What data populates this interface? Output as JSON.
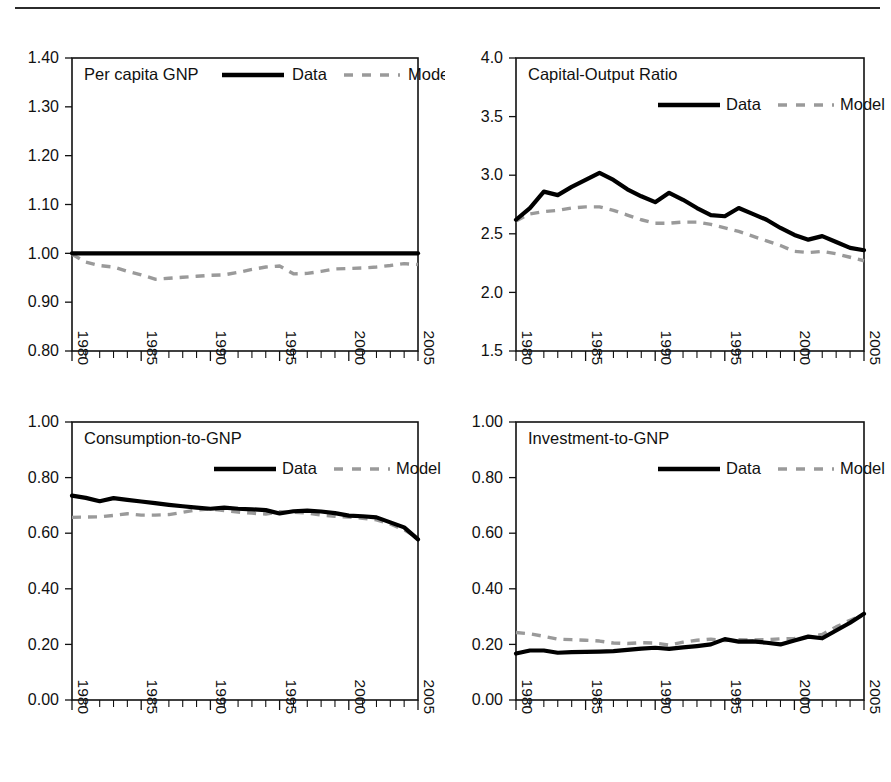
{
  "figure": {
    "top_rule": true,
    "layout": "2x2 grid of line charts",
    "legend_labels": {
      "data": "Data",
      "model": "Model"
    },
    "colors": {
      "data": "#000000",
      "model": "#9a9a9a",
      "axis": "#111111"
    }
  },
  "chart_data": [
    {
      "type": "line",
      "title": "Per capita GNP",
      "xlabel": "",
      "ylabel": "",
      "xlim": [
        1980,
        2005
      ],
      "ylim": [
        0.8,
        1.4
      ],
      "ytick_labels": [
        "0.80",
        "0.90",
        "1.00",
        "1.10",
        "1.20",
        "1.30",
        "1.40"
      ],
      "ytick_values": [
        0.8,
        0.9,
        1.0,
        1.1,
        1.2,
        1.3,
        1.4
      ],
      "xtick_labels": [
        "1980",
        "1985",
        "1990",
        "1995",
        "2000",
        "2005"
      ],
      "xtick_values": [
        1980,
        1985,
        1990,
        1995,
        2000,
        2005
      ],
      "grid": false,
      "legend_position": "top-inside",
      "x": [
        1980,
        1981,
        1982,
        1983,
        1984,
        1985,
        1986,
        1987,
        1988,
        1989,
        1990,
        1991,
        1992,
        1993,
        1994,
        1995,
        1996,
        1997,
        1998,
        1999,
        2000,
        2001,
        2002,
        2003,
        2004,
        2005
      ],
      "series": [
        {
          "name": "Data",
          "style": "solid",
          "values": [
            1.0,
            1.0,
            1.0,
            1.0,
            1.0,
            1.0,
            1.0,
            1.0,
            1.0,
            1.0,
            1.0,
            1.0,
            1.0,
            1.0,
            1.0,
            1.0,
            1.0,
            1.0,
            1.0,
            1.0,
            1.0,
            1.0,
            1.0,
            1.0,
            1.0,
            1.0
          ]
        },
        {
          "name": "Model",
          "style": "dashed",
          "values": [
            0.998,
            0.982,
            0.975,
            0.972,
            0.963,
            0.956,
            0.947,
            0.949,
            0.951,
            0.953,
            0.955,
            0.956,
            0.961,
            0.967,
            0.972,
            0.974,
            0.958,
            0.959,
            0.963,
            0.968,
            0.969,
            0.97,
            0.972,
            0.975,
            0.979,
            0.977
          ]
        }
      ]
    },
    {
      "type": "line",
      "title": "Capital-Output Ratio",
      "xlabel": "",
      "ylabel": "",
      "xlim": [
        1980,
        2005
      ],
      "ylim": [
        1.5,
        4.0
      ],
      "ytick_labels": [
        "1.5",
        "2.0",
        "2.5",
        "3.0",
        "3.5",
        "4.0"
      ],
      "ytick_values": [
        1.5,
        2.0,
        2.5,
        3.0,
        3.5,
        4.0
      ],
      "xtick_labels": [
        "1980",
        "1985",
        "1990",
        "1995",
        "2000",
        "2005"
      ],
      "xtick_values": [
        1980,
        1985,
        1990,
        1995,
        2000,
        2005
      ],
      "grid": false,
      "legend_position": "top-inside",
      "x": [
        1980,
        1981,
        1982,
        1983,
        1984,
        1985,
        1986,
        1987,
        1988,
        1989,
        1990,
        1991,
        1992,
        1993,
        1994,
        1995,
        1996,
        1997,
        1998,
        1999,
        2000,
        2001,
        2002,
        2003,
        2004,
        2005
      ],
      "series": [
        {
          "name": "Data",
          "style": "solid",
          "values": [
            2.62,
            2.72,
            2.86,
            2.83,
            2.9,
            2.96,
            3.02,
            2.96,
            2.88,
            2.82,
            2.77,
            2.85,
            2.79,
            2.72,
            2.66,
            2.65,
            2.72,
            2.67,
            2.62,
            2.55,
            2.49,
            2.45,
            2.48,
            2.43,
            2.38,
            2.36
          ]
        },
        {
          "name": "Model",
          "style": "dashed",
          "values": [
            2.61,
            2.67,
            2.69,
            2.7,
            2.72,
            2.73,
            2.73,
            2.7,
            2.66,
            2.62,
            2.59,
            2.59,
            2.6,
            2.6,
            2.58,
            2.55,
            2.52,
            2.48,
            2.44,
            2.4,
            2.35,
            2.34,
            2.35,
            2.33,
            2.3,
            2.27
          ]
        }
      ]
    },
    {
      "type": "line",
      "title": "Consumption-to-GNP",
      "xlabel": "",
      "ylabel": "",
      "xlim": [
        1980,
        2005
      ],
      "ylim": [
        0.0,
        1.0
      ],
      "ytick_labels": [
        "0.00",
        "0.20",
        "0.40",
        "0.60",
        "0.80",
        "1.00"
      ],
      "ytick_values": [
        0.0,
        0.2,
        0.4,
        0.6,
        0.8,
        1.0
      ],
      "xtick_labels": [
        "1980",
        "1985",
        "1990",
        "1995",
        "2000",
        "2005"
      ],
      "xtick_values": [
        1980,
        1985,
        1990,
        1995,
        2000,
        2005
      ],
      "grid": false,
      "legend_position": "top-inside",
      "x": [
        1980,
        1981,
        1982,
        1983,
        1984,
        1985,
        1986,
        1987,
        1988,
        1989,
        1990,
        1991,
        1992,
        1993,
        1994,
        1995,
        1996,
        1997,
        1998,
        1999,
        2000,
        2001,
        2002,
        2003,
        2004,
        2005
      ],
      "series": [
        {
          "name": "Data",
          "style": "solid",
          "values": [
            0.735,
            0.727,
            0.715,
            0.726,
            0.72,
            0.714,
            0.708,
            0.702,
            0.697,
            0.692,
            0.688,
            0.692,
            0.688,
            0.686,
            0.683,
            0.671,
            0.679,
            0.681,
            0.678,
            0.672,
            0.663,
            0.661,
            0.657,
            0.639,
            0.621,
            0.578
          ]
        },
        {
          "name": "Model",
          "style": "dashed",
          "values": [
            0.657,
            0.658,
            0.659,
            0.664,
            0.67,
            0.665,
            0.665,
            0.667,
            0.675,
            0.684,
            0.687,
            0.681,
            0.676,
            0.672,
            0.669,
            0.677,
            0.676,
            0.672,
            0.665,
            0.661,
            0.658,
            0.654,
            0.648,
            0.633,
            0.612,
            0.583
          ]
        }
      ]
    },
    {
      "type": "line",
      "title": "Investment-to-GNP",
      "xlabel": "",
      "ylabel": "",
      "xlim": [
        1980,
        2005
      ],
      "ylim": [
        0.0,
        1.0
      ],
      "ytick_labels": [
        "0.00",
        "0.20",
        "0.40",
        "0.60",
        "0.80",
        "1.00"
      ],
      "ytick_values": [
        0.0,
        0.2,
        0.4,
        0.6,
        0.8,
        1.0
      ],
      "xtick_labels": [
        "1980",
        "1985",
        "1990",
        "1995",
        "2000",
        "2005"
      ],
      "xtick_values": [
        1980,
        1985,
        1990,
        1995,
        2000,
        2005
      ],
      "grid": false,
      "legend_position": "top-inside",
      "x": [
        1980,
        1981,
        1982,
        1983,
        1984,
        1985,
        1986,
        1987,
        1988,
        1989,
        1990,
        1991,
        1992,
        1993,
        1994,
        1995,
        1996,
        1997,
        1998,
        1999,
        2000,
        2001,
        2002,
        2003,
        2004,
        2005
      ],
      "series": [
        {
          "name": "Data",
          "style": "solid",
          "values": [
            0.167,
            0.178,
            0.178,
            0.17,
            0.172,
            0.173,
            0.174,
            0.176,
            0.18,
            0.185,
            0.188,
            0.184,
            0.189,
            0.194,
            0.2,
            0.219,
            0.21,
            0.211,
            0.206,
            0.2,
            0.214,
            0.228,
            0.222,
            0.25,
            0.278,
            0.31
          ]
        },
        {
          "name": "Model",
          "style": "dashed",
          "values": [
            0.243,
            0.238,
            0.229,
            0.219,
            0.217,
            0.215,
            0.212,
            0.205,
            0.203,
            0.206,
            0.205,
            0.198,
            0.208,
            0.215,
            0.219,
            0.214,
            0.217,
            0.216,
            0.217,
            0.22,
            0.221,
            0.226,
            0.236,
            0.263,
            0.287,
            0.308
          ]
        }
      ]
    }
  ]
}
